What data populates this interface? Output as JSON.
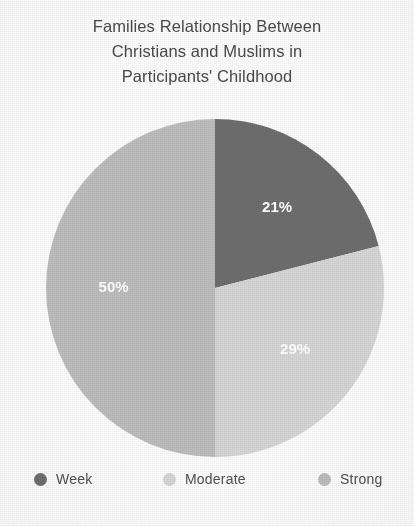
{
  "chart_data": {
    "type": "pie",
    "title": "Families Relationship Between Christians and Muslims in Participants' Childhood",
    "title_lines": [
      "Families Relationship Between",
      "Christians and Muslims in",
      "Participants' Childhood"
    ],
    "categories": [
      "Week",
      "Moderate",
      "Strong"
    ],
    "values": [
      21,
      29,
      50
    ],
    "value_labels": [
      "21%",
      "29%",
      "50%"
    ],
    "unit": "%",
    "colors": [
      "#6e6e6e",
      "#d6d6d6",
      "#bdbdbd"
    ],
    "label_color": "#ffffff",
    "start_angle_deg": 0,
    "direction": "clockwise",
    "legend": {
      "position": "bottom",
      "entries": [
        {
          "label": "Week",
          "color": "#6e6e6e",
          "value_label": "21%"
        },
        {
          "label": "Moderate",
          "color": "#d6d6d6",
          "value_label": "29%"
        },
        {
          "label": "Strong",
          "color": "#bdbdbd",
          "value_label": "50%"
        }
      ]
    },
    "xlabel": "",
    "ylabel": "",
    "grid": false
  }
}
